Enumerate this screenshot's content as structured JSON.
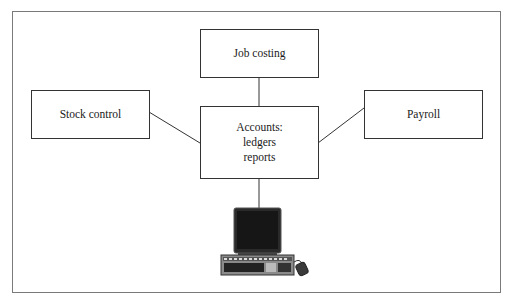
{
  "diagram": {
    "type": "hub-and-spoke system diagram",
    "nodes": [
      {
        "id": "job-costing",
        "label": "Job costing"
      },
      {
        "id": "stock-control",
        "label": "Stock control"
      },
      {
        "id": "payroll",
        "label": "Payroll"
      },
      {
        "id": "accounts",
        "label": "Accounts:\nledgers\nreports"
      }
    ],
    "edges": [
      {
        "from": "job-costing",
        "to": "accounts"
      },
      {
        "from": "stock-control",
        "to": "accounts"
      },
      {
        "from": "payroll",
        "to": "accounts"
      },
      {
        "from": "accounts",
        "to": "computer"
      }
    ],
    "computer": {
      "icon": "desktop-computer-icon",
      "parts": [
        "monitor",
        "keyboard",
        "mouse"
      ]
    },
    "colors": {
      "line": "#333333",
      "frame": "#7a7a7a",
      "screen": "#1c1c1c",
      "background": "#ffffff"
    }
  }
}
